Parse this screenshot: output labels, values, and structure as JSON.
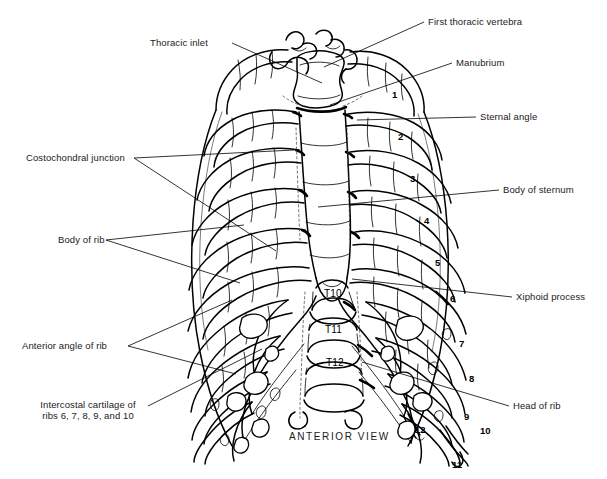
{
  "figure": {
    "view_caption": "ANTERIOR  VIEW",
    "background_color": "#ffffff",
    "line_color": "#000000"
  },
  "labels_left": [
    {
      "id": "thoracic-inlet",
      "text": "Thoracic inlet"
    },
    {
      "id": "costochondral-junction",
      "text": "Costochondral junction"
    },
    {
      "id": "body-of-rib",
      "text": "Body of rib"
    },
    {
      "id": "anterior-angle-of-rib",
      "text": "Anterior angle of rib"
    },
    {
      "id": "intercostal-cartilage",
      "text": "Intercostal cartilage of\nribs 6, 7, 8, 9, and 10"
    }
  ],
  "labels_right": [
    {
      "id": "first-thoracic-vertebra",
      "text": "First thoracic vertebra"
    },
    {
      "id": "manubrium",
      "text": "Manubrium"
    },
    {
      "id": "sternal-angle",
      "text": "Sternal angle"
    },
    {
      "id": "body-of-sternum",
      "text": "Body of sternum"
    },
    {
      "id": "xiphoid-process",
      "text": "Xiphoid process"
    },
    {
      "id": "head-of-rib",
      "text": "Head of rib"
    }
  ],
  "vertebrae": [
    {
      "id": "t10",
      "text": "T10"
    },
    {
      "id": "t11",
      "text": "T11"
    },
    {
      "id": "t12",
      "text": "T12"
    }
  ],
  "rib_numbers": [
    {
      "id": "rib-1",
      "text": "1"
    },
    {
      "id": "rib-2",
      "text": "2"
    },
    {
      "id": "rib-3",
      "text": "3"
    },
    {
      "id": "rib-4",
      "text": "4"
    },
    {
      "id": "rib-5",
      "text": "5"
    },
    {
      "id": "rib-6",
      "text": "6"
    },
    {
      "id": "rib-7",
      "text": "7"
    },
    {
      "id": "rib-8",
      "text": "8"
    },
    {
      "id": "rib-9",
      "text": "9"
    },
    {
      "id": "rib-10",
      "text": "10"
    },
    {
      "id": "rib-11",
      "text": "11"
    },
    {
      "id": "rib-12",
      "text": "12"
    }
  ]
}
